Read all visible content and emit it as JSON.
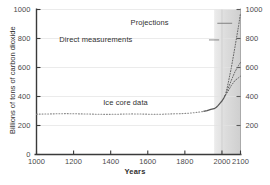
{
  "chart_data": {
    "type": "line",
    "title": "",
    "xlabel": "Years",
    "ylabel": "Billions of tons of carbon dioxide",
    "xlim": [
      1000,
      2100
    ],
    "ylim": [
      0,
      1000
    ],
    "grid": true,
    "legend": "none",
    "x_ticks": [
      {
        "value": 1000,
        "label": "1000"
      },
      {
        "value": 1200,
        "label": "1200"
      },
      {
        "value": 1400,
        "label": "1400"
      },
      {
        "value": 1600,
        "label": "1600"
      },
      {
        "value": 1800,
        "label": "1800"
      },
      {
        "value": 2000,
        "label": "2000"
      },
      {
        "value": 2100,
        "label": "2100"
      }
    ],
    "y_ticks_left": [
      {
        "value": 0,
        "label": "0"
      },
      {
        "value": 200,
        "label": "200"
      },
      {
        "value": 400,
        "label": "400"
      },
      {
        "value": 600,
        "label": "600"
      },
      {
        "value": 800,
        "label": "800"
      },
      {
        "value": 1000,
        "label": "1000"
      }
    ],
    "y_ticks_right": [
      {
        "value": 200,
        "label": "200"
      },
      {
        "value": 400,
        "label": "400"
      },
      {
        "value": 600,
        "label": "600"
      },
      {
        "value": 800,
        "label": "800"
      },
      {
        "value": 1000,
        "label": "1000"
      }
    ],
    "shaded_region": {
      "x_start": 1958,
      "x_end": 2100,
      "fill": "#d8d8d8"
    },
    "annotations": [
      {
        "name": "ice-core-data",
        "text": "Ice core data",
        "x": 1480,
        "y": 355
      },
      {
        "name": "direct-measurements",
        "text": "Direct measurements",
        "x": 1320,
        "y": 790
      },
      {
        "name": "projections",
        "text": "Projections",
        "x": 1610,
        "y": 905
      }
    ],
    "series": [
      {
        "name": "Ice core data",
        "style": "scatter-dotted",
        "color": "#8a8a8a",
        "x": [
          1000,
          1040,
          1080,
          1120,
          1160,
          1200,
          1240,
          1280,
          1320,
          1360,
          1400,
          1440,
          1480,
          1520,
          1560,
          1600,
          1640,
          1680,
          1720,
          1760,
          1800,
          1840,
          1870,
          1900
        ],
        "y": [
          278,
          279,
          280,
          281,
          282,
          281,
          280,
          279,
          278,
          277,
          277,
          278,
          279,
          280,
          279,
          278,
          277,
          278,
          280,
          281,
          283,
          287,
          291,
          297
        ]
      },
      {
        "name": "Direct measurements",
        "style": "solid",
        "color": "#555555",
        "x": [
          1900,
          1920,
          1940,
          1958,
          1970,
          1980,
          1990,
          2000,
          2010,
          2018
        ],
        "y": [
          297,
          303,
          311,
          316,
          326,
          339,
          354,
          369,
          389,
          408
        ]
      },
      {
        "name": "Projection low",
        "style": "dotted",
        "color": "#666666",
        "x": [
          2018,
          2030,
          2050,
          2070,
          2090,
          2100
        ],
        "y": [
          408,
          430,
          475,
          510,
          530,
          540
        ]
      },
      {
        "name": "Projection mid",
        "style": "dotted",
        "color": "#666666",
        "x": [
          2018,
          2030,
          2050,
          2070,
          2090,
          2100
        ],
        "y": [
          408,
          445,
          510,
          570,
          615,
          635
        ]
      },
      {
        "name": "Projection high",
        "style": "dotted",
        "color": "#666666",
        "x": [
          2018,
          2030,
          2050,
          2070,
          2090,
          2100
        ],
        "y": [
          408,
          470,
          595,
          740,
          890,
          975
        ]
      }
    ]
  }
}
